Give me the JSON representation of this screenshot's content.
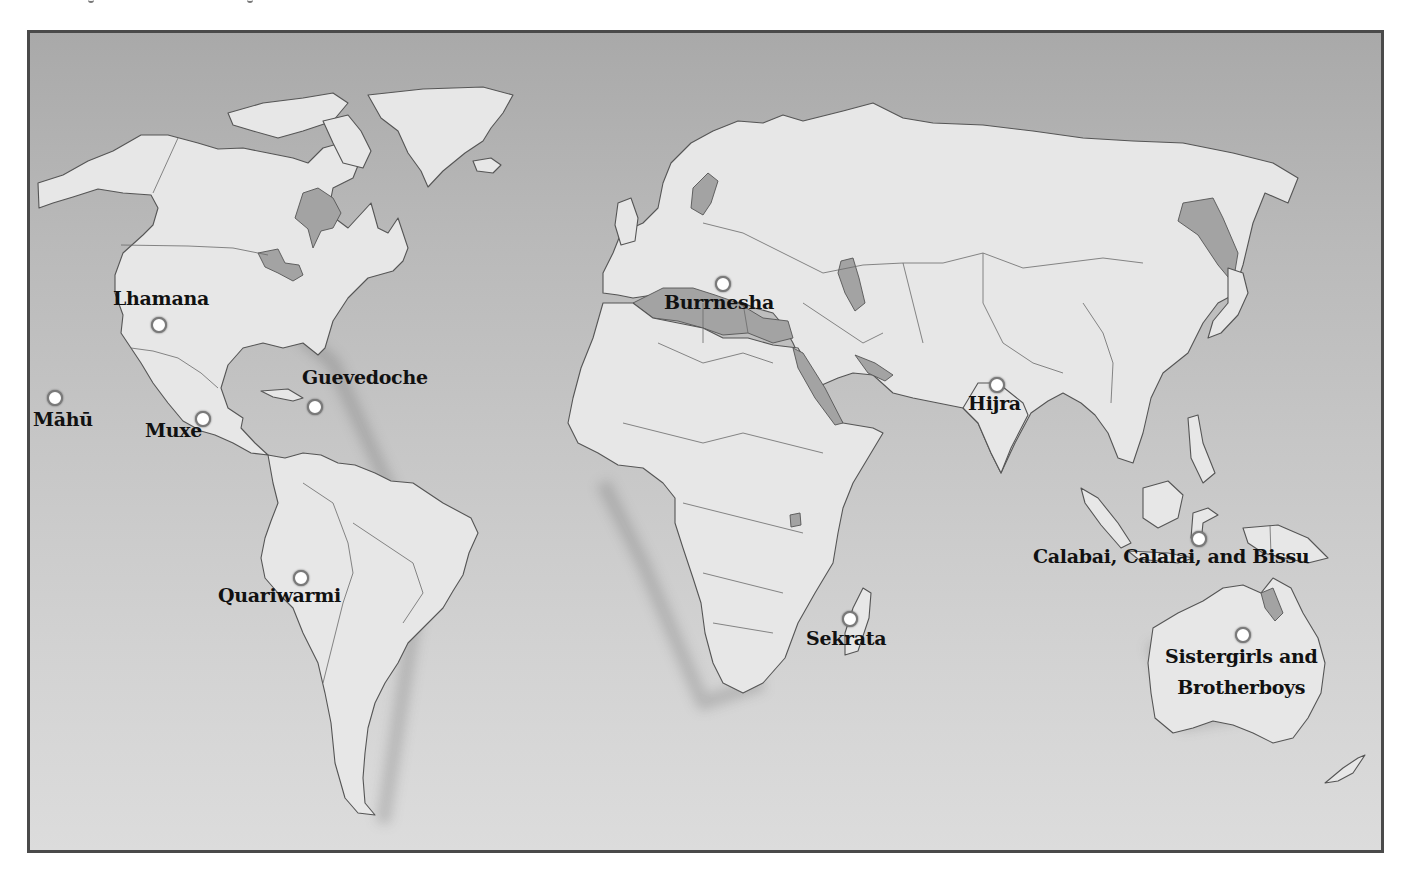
{
  "map": {
    "title": "",
    "colors": {
      "water_top": "#a9a9a9",
      "water_bottom": "#dcdcdc",
      "land": "#e7e7e7",
      "inland_water": "#a3a3a3",
      "frame": "#4a4a4a",
      "marker_fill": "#ffffff",
      "label_text": "#111111"
    },
    "locations": [
      {
        "name": "Lhamana",
        "label": "Lhamana",
        "marker": [
          159,
          325
        ],
        "label_pos": [
          113,
          289
        ],
        "label_lines": [
          "Lhamana"
        ]
      },
      {
        "name": "Guevedoche",
        "label": "Guevedoche",
        "marker": [
          315,
          407
        ],
        "label_pos": [
          302,
          368
        ],
        "label_lines": [
          "Guevedoche"
        ]
      },
      {
        "name": "Mahu",
        "label": "Māhū",
        "marker": [
          55,
          398
        ],
        "label_pos": [
          33,
          410
        ],
        "label_lines": [
          "Māhū"
        ]
      },
      {
        "name": "Muxe",
        "label": "Muxe",
        "marker": [
          203,
          419
        ],
        "label_pos": [
          145,
          421
        ],
        "label_lines": [
          "Muxe"
        ]
      },
      {
        "name": "Quariwarmi",
        "label": "Quariwarmi",
        "marker": [
          301,
          578
        ],
        "label_pos": [
          218,
          586
        ],
        "label_lines": [
          "Quariwarmi"
        ]
      },
      {
        "name": "Burrnesha",
        "label": "Burrnesha",
        "marker": [
          723,
          284
        ],
        "label_pos": [
          664,
          293
        ],
        "label_lines": [
          "Burrnesha"
        ]
      },
      {
        "name": "Sekrata",
        "label": "Sekrata",
        "marker": [
          850,
          619
        ],
        "label_pos": [
          806,
          629
        ],
        "label_lines": [
          "Sekrata"
        ]
      },
      {
        "name": "Hijra",
        "label": "Hijra",
        "marker": [
          997,
          385
        ],
        "label_pos": [
          968,
          394
        ],
        "label_lines": [
          "Hijra"
        ]
      },
      {
        "name": "Calabai",
        "label": "Calabai, Calalai, and Bissu",
        "marker": [
          1199,
          539
        ],
        "label_pos": [
          1033,
          547
        ],
        "label_lines": [
          "Calabai, Calalai, and Bissu"
        ]
      },
      {
        "name": "Sistergirls",
        "label": "Sistergirls and Brotherboys",
        "marker": [
          1243,
          635
        ],
        "label_pos": [
          1165,
          647
        ],
        "label_lines": [
          "Sistergirls and",
          "Brotherboys"
        ]
      }
    ]
  }
}
